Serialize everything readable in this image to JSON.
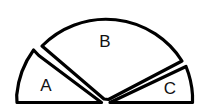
{
  "figure": {
    "kind": "sector-diagram",
    "background_color": "#ffffff",
    "stroke_color": "#000000",
    "fill_color": "#ffffff",
    "label_color": "#111111",
    "stroke_width": 3.2,
    "center": {
      "x": 105,
      "y": 103
    },
    "radius": 90,
    "total_span_degrees": 180,
    "sectors": [
      {
        "id": "sector-a",
        "label": "A",
        "label_x": 46,
        "label_y": 87,
        "start_angle_deg": 180,
        "end_angle_deg": 144,
        "sweep_deg": 36,
        "path": "M 17.0 102.5 L 16.7 95.0 A 90 90 0 0 1 33.6 50.0 L 38.8 55.5 L 101.5 102.5 Z"
      },
      {
        "id": "sector-b",
        "label": "B",
        "label_x": 105,
        "label_y": 43,
        "start_angle_deg": 140,
        "end_angle_deg": 28,
        "sweep_deg": 112,
        "path": "M 104.0 99.0 L 42.0 46.0 A 90 90 0 0 1 182.0 61.0 L 108.5 99.5 Z"
      },
      {
        "id": "sector-c",
        "label": "C",
        "label_x": 170,
        "label_y": 90,
        "start_angle_deg": 25,
        "end_angle_deg": 0,
        "sweep_deg": 25,
        "path": "M 110.0 102.5 L 186.0 66.5 A 90 90 0 0 1 192.5 95.0 L 192.5 102.5 Z"
      }
    ]
  }
}
